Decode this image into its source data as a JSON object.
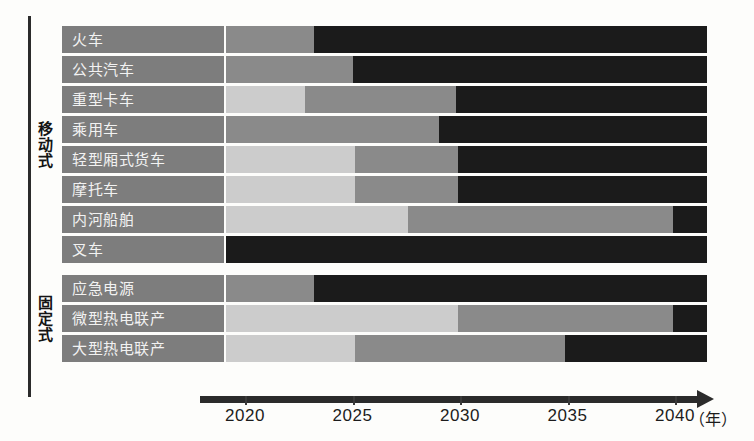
{
  "chart_data": {
    "type": "bar",
    "subtype": "stacked-timeline-gantt",
    "title": "",
    "xlabel": "年",
    "ylabel": "",
    "xlim": [
      2018.5,
      2041.5
    ],
    "grid": false,
    "legend": "none",
    "axis": {
      "unit_label": "（年）",
      "ticks": [
        {
          "label": "2020",
          "value": 2020,
          "x": 245
        },
        {
          "label": "2025",
          "value": 2025,
          "x": 352
        },
        {
          "label": "2030",
          "value": 2030,
          "x": 460
        },
        {
          "label": "2035",
          "value": 2035,
          "x": 567
        },
        {
          "label": "2040",
          "value": 2040,
          "x": 675
        }
      ]
    },
    "groups": [
      {
        "name": "移动式",
        "rows": 8
      },
      {
        "name": "固定式",
        "rows": 3
      }
    ],
    "categories": [
      "火车",
      "公共汽车",
      "重型卡车",
      "乘用车",
      "轻型厢式货车",
      "摩托车",
      "内河船舶",
      "叉车",
      "应急电源",
      "微型热电联产",
      "大型热电联产"
    ],
    "shade_meaning": {
      "light": "早期阶段",
      "mid": "中期阶段",
      "dark": "成熟阶段"
    },
    "rows": [
      {
        "label": "火车",
        "group": "移动式",
        "segments": [
          {
            "shade": "mid",
            "start": 2019,
            "end": 2023.2
          },
          {
            "shade": "dark",
            "start": 2023.2,
            "end": 2041.5
          }
        ]
      },
      {
        "label": "公共汽车",
        "group": "移动式",
        "segments": [
          {
            "shade": "mid",
            "start": 2019,
            "end": 2025.0
          },
          {
            "shade": "dark",
            "start": 2025.0,
            "end": 2041.5
          }
        ]
      },
      {
        "label": "重型卡车",
        "group": "移动式",
        "segments": [
          {
            "shade": "light",
            "start": 2019,
            "end": 2022.8
          },
          {
            "shade": "mid",
            "start": 2022.8,
            "end": 2029.8
          },
          {
            "shade": "dark",
            "start": 2029.8,
            "end": 2041.5
          }
        ]
      },
      {
        "label": "乘用车",
        "group": "移动式",
        "segments": [
          {
            "shade": "mid",
            "start": 2019,
            "end": 2029.0
          },
          {
            "shade": "dark",
            "start": 2029.0,
            "end": 2041.5
          }
        ]
      },
      {
        "label": "轻型厢式货车",
        "group": "移动式",
        "segments": [
          {
            "shade": "light",
            "start": 2019,
            "end": 2025.1
          },
          {
            "shade": "mid",
            "start": 2025.1,
            "end": 2029.9
          },
          {
            "shade": "dark",
            "start": 2029.9,
            "end": 2041.5
          }
        ]
      },
      {
        "label": "摩托车",
        "group": "移动式",
        "segments": [
          {
            "shade": "light",
            "start": 2019,
            "end": 2025.1
          },
          {
            "shade": "mid",
            "start": 2025.1,
            "end": 2029.9
          },
          {
            "shade": "dark",
            "start": 2029.9,
            "end": 2041.5
          }
        ]
      },
      {
        "label": "内河船舶",
        "group": "移动式",
        "segments": [
          {
            "shade": "light",
            "start": 2019,
            "end": 2027.6
          },
          {
            "shade": "mid",
            "start": 2027.6,
            "end": 2039.9
          },
          {
            "shade": "dark",
            "start": 2039.9,
            "end": 2041.5
          }
        ]
      },
      {
        "label": "叉车",
        "group": "移动式",
        "segments": [
          {
            "shade": "dark",
            "start": 2019,
            "end": 2041.5
          }
        ]
      },
      {
        "label": "应急电源",
        "group": "固定式",
        "segments": [
          {
            "shade": "mid",
            "start": 2019,
            "end": 2023.2
          },
          {
            "shade": "dark",
            "start": 2023.2,
            "end": 2041.5
          }
        ]
      },
      {
        "label": "微型热电联产",
        "group": "固定式",
        "segments": [
          {
            "shade": "light",
            "start": 2019,
            "end": 2029.9
          },
          {
            "shade": "mid",
            "start": 2029.9,
            "end": 2039.9
          },
          {
            "shade": "dark",
            "start": 2039.9,
            "end": 2041.5
          }
        ]
      },
      {
        "label": "大型热电联产",
        "group": "固定式",
        "segments": [
          {
            "shade": "light",
            "start": 2019,
            "end": 2025.1
          },
          {
            "shade": "mid",
            "start": 2025.1,
            "end": 2034.9
          },
          {
            "shade": "dark",
            "start": 2034.9,
            "end": 2041.5
          }
        ]
      }
    ]
  },
  "colors": {
    "light": "#cccccc",
    "mid": "#8a8a8a",
    "dark": "#1b1b1b",
    "label_bar": "#7d7d7d",
    "axis": "#2b2b2b",
    "background": "#fdfdfb"
  }
}
